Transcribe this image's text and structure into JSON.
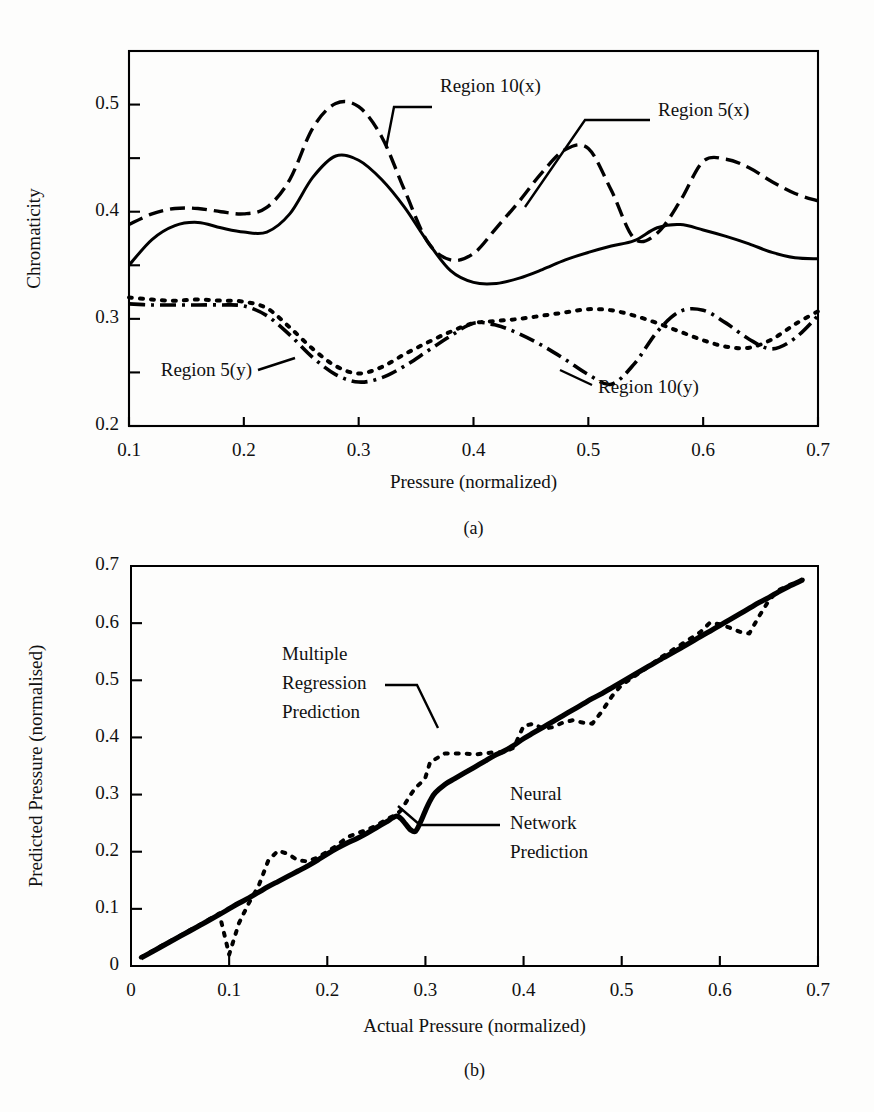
{
  "figure": {
    "background_color": "#fdfdfc",
    "ink_color": "#000000"
  },
  "panel_a": {
    "caption": "(a)",
    "xlabel": "Pressure (normalized)",
    "ylabel": "Chromaticity",
    "xticklabels": [
      "0.1",
      "0.2",
      "0.3",
      "0.4",
      "0.5",
      "0.6",
      "0.7"
    ],
    "yticklabels": [
      "0.2",
      "0.3",
      "0.4",
      "0.5"
    ],
    "annotations": [
      {
        "label": "Region 10(x)",
        "anchor": "left"
      },
      {
        "label": "Region 5(x)",
        "anchor": "left"
      },
      {
        "label": "Region 5(y)",
        "anchor": "right"
      },
      {
        "label": "Region 10(y)",
        "anchor": "left"
      }
    ]
  },
  "panel_b": {
    "caption": "(b)",
    "xlabel": "Actual Pressure (normalized)",
    "ylabel": "Predicted Pressure (normalised)",
    "xticklabels": [
      "0",
      "0.1",
      "0.2",
      "0.3",
      "0.4",
      "0.5",
      "0.6",
      "0.7"
    ],
    "yticklabels": [
      "0",
      "0.1",
      "0.2",
      "0.3",
      "0.4",
      "0.5",
      "0.6",
      "0.7"
    ],
    "annotations": [
      {
        "lines": [
          "Multiple",
          "Regression",
          "Prediction"
        ]
      },
      {
        "lines": [
          "Neural",
          "Network",
          "Prediction"
        ]
      }
    ]
  },
  "chart_data": [
    {
      "type": "line",
      "title": "",
      "panel": "(a)",
      "xlabel": "Pressure (normalized)",
      "ylabel": "Chromaticity",
      "xlim": [
        0.1,
        0.7
      ],
      "ylim": [
        0.2,
        0.55
      ],
      "xticks": [
        0.1,
        0.2,
        0.3,
        0.4,
        0.5,
        0.6,
        0.7
      ],
      "yticks": [
        0.2,
        0.25,
        0.3,
        0.35,
        0.4,
        0.45,
        0.5
      ],
      "ymajorticks": [
        0.2,
        0.3,
        0.4,
        0.5
      ],
      "grid": false,
      "legend": "inline-annotations",
      "x": [
        0.1,
        0.12,
        0.14,
        0.16,
        0.18,
        0.2,
        0.22,
        0.24,
        0.26,
        0.28,
        0.3,
        0.32,
        0.34,
        0.36,
        0.38,
        0.4,
        0.42,
        0.44,
        0.46,
        0.48,
        0.5,
        0.52,
        0.54,
        0.56,
        0.58,
        0.6,
        0.62,
        0.64,
        0.66,
        0.68,
        0.7
      ],
      "series": [
        {
          "name": "Region 5(x)",
          "style": "solid",
          "values": [
            0.35,
            0.374,
            0.387,
            0.39,
            0.385,
            0.381,
            0.381,
            0.398,
            0.432,
            0.452,
            0.448,
            0.43,
            0.404,
            0.372,
            0.345,
            0.334,
            0.333,
            0.338,
            0.346,
            0.355,
            0.362,
            0.368,
            0.373,
            0.385,
            0.388,
            0.383,
            0.377,
            0.37,
            0.362,
            0.357,
            0.356
          ]
        },
        {
          "name": "Region 10(x)",
          "style": "dashed",
          "values": [
            0.388,
            0.398,
            0.403,
            0.403,
            0.4,
            0.398,
            0.404,
            0.43,
            0.478,
            0.501,
            0.498,
            0.47,
            0.42,
            0.372,
            0.355,
            0.361,
            0.385,
            0.41,
            0.437,
            0.458,
            0.459,
            0.42,
            0.375,
            0.38,
            0.41,
            0.447,
            0.449,
            0.441,
            0.428,
            0.417,
            0.41
          ]
        },
        {
          "name": "Region 5(y)",
          "style": "dotted",
          "values": [
            0.32,
            0.318,
            0.317,
            0.318,
            0.317,
            0.316,
            0.31,
            0.292,
            0.272,
            0.256,
            0.249,
            0.255,
            0.267,
            0.278,
            0.288,
            0.296,
            0.298,
            0.3,
            0.303,
            0.306,
            0.309,
            0.308,
            0.303,
            0.296,
            0.288,
            0.28,
            0.274,
            0.273,
            0.281,
            0.295,
            0.307
          ]
        },
        {
          "name": "Region 10(y)",
          "style": "dashdot",
          "values": [
            0.314,
            0.313,
            0.313,
            0.313,
            0.313,
            0.312,
            0.303,
            0.285,
            0.264,
            0.248,
            0.241,
            0.245,
            0.256,
            0.27,
            0.284,
            0.296,
            0.294,
            0.286,
            0.275,
            0.262,
            0.248,
            0.239,
            0.258,
            0.288,
            0.307,
            0.308,
            0.296,
            0.281,
            0.272,
            0.282,
            0.303
          ]
        }
      ]
    },
    {
      "type": "line",
      "title": "",
      "panel": "(b)",
      "xlabel": "Actual Pressure (normalized)",
      "ylabel": "Predicted Pressure (normalised)",
      "xlim": [
        0.0,
        0.7
      ],
      "ylim": [
        0.0,
        0.7
      ],
      "xticks": [
        0.0,
        0.1,
        0.2,
        0.3,
        0.4,
        0.5,
        0.6,
        0.7
      ],
      "yticks": [
        0.0,
        0.1,
        0.2,
        0.3,
        0.4,
        0.5,
        0.6,
        0.7
      ],
      "grid": false,
      "legend": "inline-annotations",
      "x": [
        0.01,
        0.03,
        0.05,
        0.07,
        0.09,
        0.1,
        0.11,
        0.12,
        0.13,
        0.14,
        0.15,
        0.16,
        0.17,
        0.18,
        0.19,
        0.2,
        0.21,
        0.22,
        0.23,
        0.24,
        0.25,
        0.26,
        0.27,
        0.275,
        0.28,
        0.285,
        0.29,
        0.295,
        0.3,
        0.305,
        0.31,
        0.32,
        0.33,
        0.34,
        0.35,
        0.36,
        0.37,
        0.38,
        0.39,
        0.4,
        0.41,
        0.42,
        0.43,
        0.44,
        0.45,
        0.46,
        0.47,
        0.48,
        0.49,
        0.5,
        0.52,
        0.54,
        0.56,
        0.58,
        0.59,
        0.6,
        0.61,
        0.62,
        0.63,
        0.64,
        0.65,
        0.66,
        0.67,
        0.685
      ],
      "series": [
        {
          "name": "Neural Network Prediction",
          "style": "thick-solid",
          "values": [
            0.014,
            0.033,
            0.052,
            0.071,
            0.09,
            0.1,
            0.11,
            0.119,
            0.129,
            0.139,
            0.148,
            0.157,
            0.166,
            0.175,
            0.185,
            0.196,
            0.206,
            0.215,
            0.223,
            0.232,
            0.242,
            0.252,
            0.262,
            0.258,
            0.248,
            0.238,
            0.236,
            0.252,
            0.272,
            0.29,
            0.303,
            0.318,
            0.328,
            0.338,
            0.348,
            0.358,
            0.368,
            0.376,
            0.386,
            0.398,
            0.408,
            0.418,
            0.428,
            0.438,
            0.448,
            0.458,
            0.468,
            0.477,
            0.487,
            0.497,
            0.517,
            0.537,
            0.556,
            0.576,
            0.586,
            0.596,
            0.606,
            0.616,
            0.626,
            0.636,
            0.645,
            0.655,
            0.664,
            0.676
          ]
        },
        {
          "name": "Multiple Regression Prediction",
          "style": "dotted",
          "values": [
            0.015,
            0.034,
            0.053,
            0.072,
            0.092,
            0.02,
            0.075,
            0.11,
            0.14,
            0.185,
            0.202,
            0.196,
            0.185,
            0.183,
            0.19,
            0.2,
            0.211,
            0.225,
            0.232,
            0.238,
            0.246,
            0.256,
            0.265,
            0.272,
            0.286,
            0.3,
            0.312,
            0.32,
            0.33,
            0.358,
            0.362,
            0.372,
            0.372,
            0.372,
            0.37,
            0.372,
            0.374,
            0.374,
            0.382,
            0.42,
            0.424,
            0.415,
            0.418,
            0.426,
            0.43,
            0.426,
            0.424,
            0.446,
            0.472,
            0.492,
            0.515,
            0.54,
            0.562,
            0.584,
            0.601,
            0.598,
            0.592,
            0.585,
            0.582,
            0.612,
            0.64,
            0.658,
            0.666,
            0.676
          ]
        }
      ]
    }
  ]
}
